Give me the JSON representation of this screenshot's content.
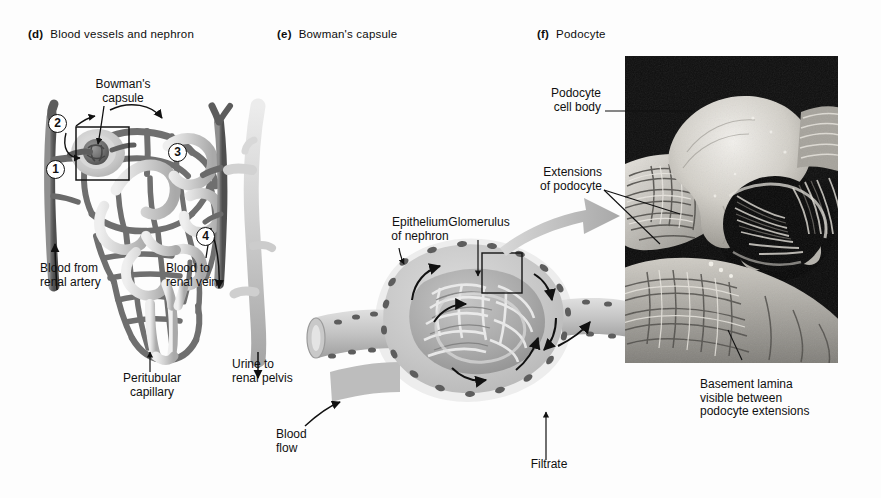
{
  "figure": {
    "background_color": "#fdfdfd",
    "ink_color": "#111111"
  },
  "panels": [
    {
      "letter": "(d)",
      "title": "Blood vessels and nephron"
    },
    {
      "letter": "(e)",
      "title": "Bowman's capsule"
    },
    {
      "letter": "(f)",
      "title": "Podocyte"
    }
  ],
  "panel_d": {
    "labels": {
      "bowmans_capsule": "Bowman's\ncapsule",
      "blood_from_renal_artery": "Blood from\nrenal artery",
      "blood_to_renal_vein": "Blood to\nrenal vein",
      "peritubular_capillary": "Peritubular\ncapillary",
      "urine_to_renal_pelvis": "Urine to\nrenal pelvis"
    },
    "steps": [
      {
        "number": "1"
      },
      {
        "number": "2"
      },
      {
        "number": "3"
      },
      {
        "number": "4"
      }
    ],
    "colors": {
      "vessel_dark": "#6d6d6d",
      "vessel_mid": "#8d8d8d",
      "tubule_light": "#cfcfcf",
      "tubule_highlight": "#e6e6e6"
    }
  },
  "panel_e": {
    "labels": {
      "epithelium_of_nephron": "Epithelium\nof nephron",
      "glomerulus": "Glomerulus",
      "blood_flow": "Blood\nflow",
      "filtrate": "Filtrate"
    },
    "colors": {
      "capsule_fill": "#c9c9c9",
      "capsule_halo": "#e8e8e8",
      "glomerulus_fill": "#b5b5b5",
      "nucleus": "#6b6b6b"
    }
  },
  "panel_f": {
    "labels": {
      "podocyte_cell_body": "Podocyte\ncell body",
      "extensions_of_podocyte": "Extensions\nof podocyte",
      "basement_lamina": "Basement lamina\nvisible between\npodocyte extensions"
    },
    "micrograph": {
      "kind": "scanning-electron-micrograph",
      "subject": "podocyte on glomerular capillary",
      "tone": "grayscale"
    }
  }
}
